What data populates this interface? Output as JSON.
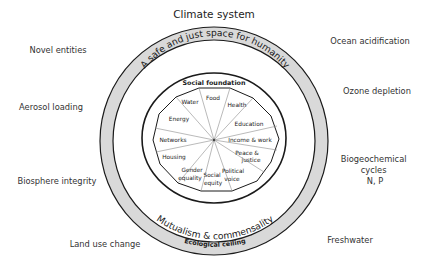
{
  "title": "Climate system",
  "ring_labels": {
    "top": "A safe and just space for humanity",
    "bottom": "Mutualism & commensality",
    "ecological_ceiling": "Ecological ceiling"
  },
  "social_foundation": {
    "title": "Social foundation",
    "sectors": [
      {
        "label": "Food"
      },
      {
        "label": "Health"
      },
      {
        "label": "Education"
      },
      {
        "label": "Income & work"
      },
      {
        "label_line1": "Peace &",
        "label_line2": "justice"
      },
      {
        "label_line1": "Political",
        "label_line2": "voice"
      },
      {
        "label_line1": "Social",
        "label_line2": "equity"
      },
      {
        "label_line1": "Gender",
        "label_line2": "equality"
      },
      {
        "label": "Housing"
      },
      {
        "label": "Networks"
      },
      {
        "label": "Energy"
      },
      {
        "label": "Water"
      }
    ]
  },
  "planetary_boundaries": {
    "left": [
      {
        "label": "Novel entities"
      },
      {
        "label": "Aerosol loading"
      },
      {
        "label": "Biosphere integrity"
      },
      {
        "label": "Land use change"
      }
    ],
    "right": [
      {
        "label": "Ocean acidification"
      },
      {
        "label": "Ozone depletion"
      },
      {
        "label_line1": "Biogeochemical",
        "label_line2": "cycles",
        "label_line3": "N, P"
      },
      {
        "label": "Freshwater"
      }
    ]
  },
  "colors": {
    "ring_fill": "#d9d9d9",
    "outline": "#1a1a1a",
    "spoke": "#8c8c8c"
  }
}
